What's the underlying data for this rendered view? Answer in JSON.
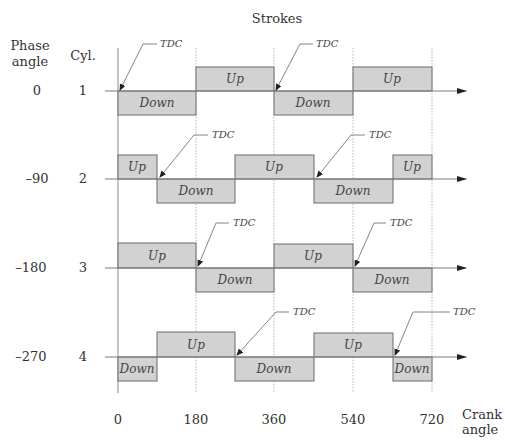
{
  "title": "Strokes",
  "headers": {
    "phase_line1": "Phase",
    "phase_line2": "angle",
    "cyl": "Cyl."
  },
  "x_axis": {
    "label_line1": "Crank",
    "label_line2": "angle",
    "ticks": [
      "0",
      "180",
      "360",
      "540",
      "720"
    ]
  },
  "tdc_label": "TDC",
  "colors": {
    "box_fill": "#d2d2d2",
    "box_stroke": "#6a6a6a"
  },
  "cylinders": [
    {
      "cyl": "1",
      "phase": "0",
      "strokes": [
        {
          "label": "Down",
          "start": 0,
          "end": 180
        },
        {
          "label": "Up",
          "start": 180,
          "end": 360
        },
        {
          "label": "Down",
          "start": 360,
          "end": 540
        },
        {
          "label": "Up",
          "start": 540,
          "end": 720
        }
      ],
      "tdc_at": [
        0,
        360
      ]
    },
    {
      "cyl": "2",
      "phase": "–90",
      "strokes": [
        {
          "label": "Up",
          "start": 0,
          "end": 90
        },
        {
          "label": "Down",
          "start": 90,
          "end": 270
        },
        {
          "label": "Up",
          "start": 270,
          "end": 450
        },
        {
          "label": "Down",
          "start": 450,
          "end": 630
        },
        {
          "label": "Up",
          "start": 630,
          "end": 720
        }
      ],
      "tdc_at": [
        90,
        450
      ]
    },
    {
      "cyl": "3",
      "phase": "–180",
      "strokes": [
        {
          "label": "Up",
          "start": 0,
          "end": 180
        },
        {
          "label": "Down",
          "start": 180,
          "end": 360
        },
        {
          "label": "Up",
          "start": 360,
          "end": 540
        },
        {
          "label": "Down",
          "start": 540,
          "end": 720
        }
      ],
      "tdc_at": [
        180,
        540
      ]
    },
    {
      "cyl": "4",
      "phase": "–270",
      "strokes": [
        {
          "label": "Down",
          "start": 0,
          "end": 90
        },
        {
          "label": "Up",
          "start": 90,
          "end": 270
        },
        {
          "label": "Down",
          "start": 270,
          "end": 450
        },
        {
          "label": "Up",
          "start": 450,
          "end": 630
        },
        {
          "label": "Down",
          "start": 630,
          "end": 720
        }
      ],
      "tdc_at": [
        270,
        630
      ]
    }
  ]
}
